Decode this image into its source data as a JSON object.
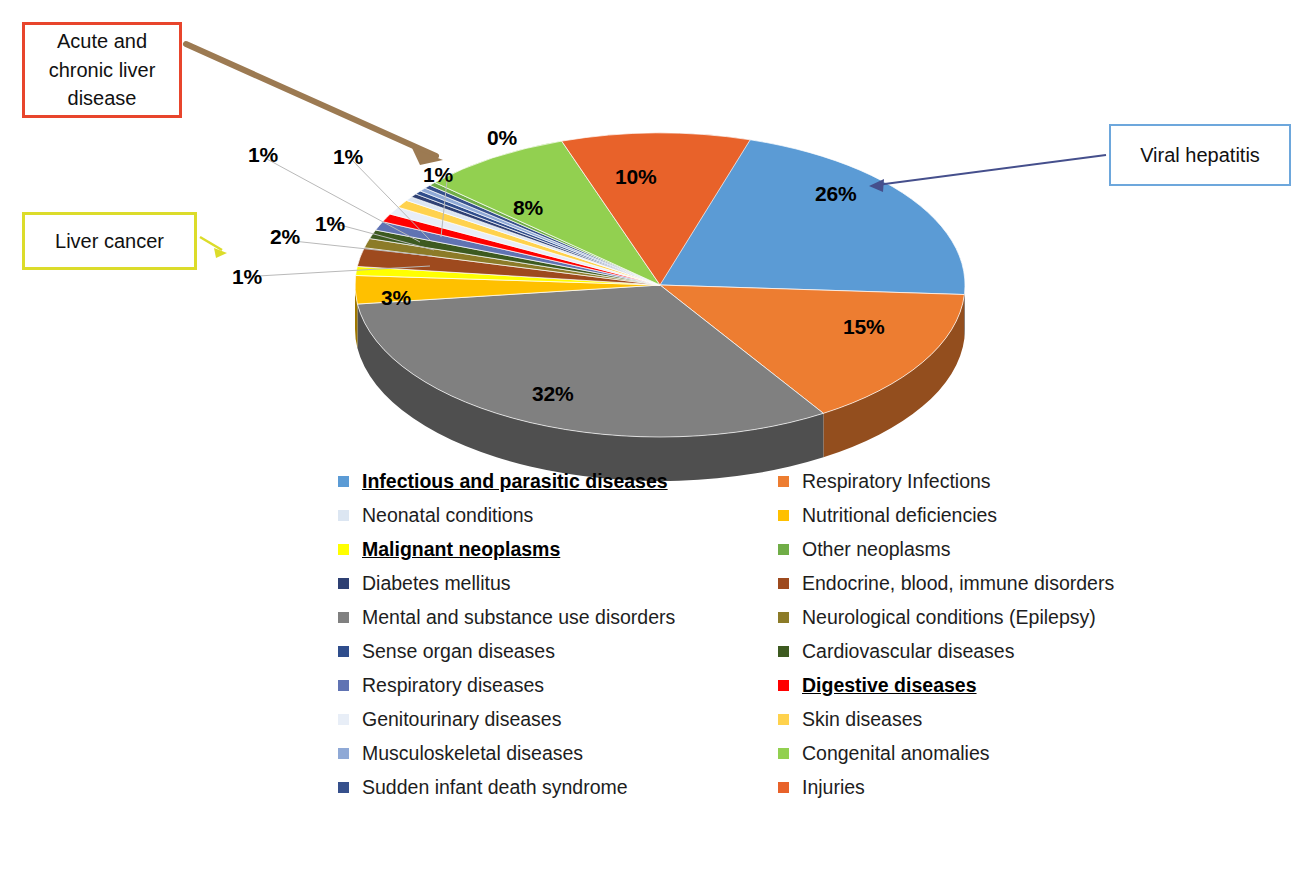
{
  "chart_data": {
    "type": "pie",
    "title": "",
    "subtitle": "",
    "xlabel": "",
    "ylabel": "",
    "legend_position": "bottom",
    "grid": false,
    "value_unit": "%",
    "categories": [
      "Infectious and parasitic diseases",
      "Respiratory Infections",
      "Neonatal conditions",
      "Nutritional deficiencies",
      "Malignant neoplasms",
      "Other neoplasms",
      "Diabetes mellitus",
      "Endocrine, blood, immune disorders",
      "Mental and substance use disorders",
      "Neurological conditions (Epilepsy)",
      "Sense organ diseases",
      "Cardiovascular diseases",
      "Respiratory diseases",
      "Digestive diseases",
      "Genitourinary diseases",
      "Skin diseases",
      "Musculoskeletal diseases",
      "Congenital anomalies",
      "Sudden infant death syndrome",
      "Injuries"
    ],
    "values": [
      26,
      15,
      0,
      3,
      1,
      0,
      0,
      2,
      32,
      1,
      0,
      1,
      1,
      1,
      1,
      1,
      0,
      8,
      0,
      10
    ],
    "slice_labels_shown": [
      "26%",
      "15%",
      "32%",
      "3%",
      "1%",
      "2%",
      "1%",
      "1%",
      "1%",
      "1%",
      "0%",
      "8%",
      "10%"
    ],
    "colors": [
      "#5b9bd5",
      "#ed7d31",
      "#dce6f2",
      "#ffc000",
      "#ffff00",
      "#70ad47",
      "#2e4073",
      "#9e4a1e",
      "#808080",
      "#8c7b28",
      "#2f4d8c",
      "#3d5a20",
      "#6073b3",
      "#ff0000",
      "#e8eef7",
      "#ffd24d",
      "#8fa9d6",
      "#92d050",
      "#36508c",
      "#e8622a"
    ]
  },
  "pie_labels": [
    {
      "text": "26%",
      "x": 815,
      "y": 182
    },
    {
      "text": "15%",
      "x": 843,
      "y": 315
    },
    {
      "text": "32%",
      "x": 532,
      "y": 382
    },
    {
      "text": "3%",
      "x": 381,
      "y": 286
    },
    {
      "text": "1%",
      "x": 232,
      "y": 265
    },
    {
      "text": "2%",
      "x": 270,
      "y": 225
    },
    {
      "text": "1%",
      "x": 315,
      "y": 212
    },
    {
      "text": "1%",
      "x": 248,
      "y": 143
    },
    {
      "text": "1%",
      "x": 333,
      "y": 145
    },
    {
      "text": "1%",
      "x": 423,
      "y": 163
    },
    {
      "text": "0%",
      "x": 487,
      "y": 126
    },
    {
      "text": "8%",
      "x": 513,
      "y": 196
    },
    {
      "text": "10%",
      "x": 615,
      "y": 165
    }
  ],
  "callouts": {
    "acute_liver": {
      "label": "Acute and chronic liver disease",
      "border_color": "#e8452c",
      "arrow_color": "#9c7a52"
    },
    "liver_cancer": {
      "label": "Liver cancer",
      "border_color": "#dcdc2a",
      "arrow_color": "#dcdc2a"
    },
    "viral_hepatitis": {
      "label": "Viral hepatitis",
      "border_color": "#6da7dc",
      "arrow_color": "#454f8c"
    }
  },
  "legend": {
    "left_column": [
      {
        "label": "Infectious and parasitic diseases",
        "color": "#5b9bd5",
        "emphasis": true
      },
      {
        "label": "Neonatal conditions",
        "color": "#dce6f2",
        "emphasis": false
      },
      {
        "label": "Malignant neoplasms",
        "color": "#ffff00",
        "emphasis": true
      },
      {
        "label": "Diabetes mellitus",
        "color": "#2e4073",
        "emphasis": false
      },
      {
        "label": "Mental and substance use disorders",
        "color": "#808080",
        "emphasis": false
      },
      {
        "label": "Sense organ diseases",
        "color": "#2f4d8c",
        "emphasis": false
      },
      {
        "label": "Respiratory diseases",
        "color": "#6073b3",
        "emphasis": false
      },
      {
        "label": "Genitourinary diseases",
        "color": "#e8eef7",
        "emphasis": false
      },
      {
        "label": "Musculoskeletal diseases",
        "color": "#8fa9d6",
        "emphasis": false
      },
      {
        "label": "Sudden infant death syndrome",
        "color": "#36508c",
        "emphasis": false
      }
    ],
    "right_column": [
      {
        "label": "Respiratory Infections",
        "color": "#ed7d31",
        "emphasis": false
      },
      {
        "label": "Nutritional deficiencies",
        "color": "#ffc000",
        "emphasis": false
      },
      {
        "label": "Other neoplasms",
        "color": "#70ad47",
        "emphasis": false
      },
      {
        "label": "Endocrine, blood, immune disorders",
        "color": "#9e4a1e",
        "emphasis": false
      },
      {
        "label": "Neurological conditions (Epilepsy)",
        "color": "#8c7b28",
        "emphasis": false
      },
      {
        "label": "Cardiovascular diseases",
        "color": "#3d5a20",
        "emphasis": false
      },
      {
        "label": "Digestive diseases",
        "color": "#ff0000",
        "emphasis": true
      },
      {
        "label": "Skin diseases",
        "color": "#ffd24d",
        "emphasis": false
      },
      {
        "label": "Congenital anomalies",
        "color": "#92d050",
        "emphasis": false
      },
      {
        "label": "Injuries",
        "color": "#e8622a",
        "emphasis": false
      }
    ]
  }
}
